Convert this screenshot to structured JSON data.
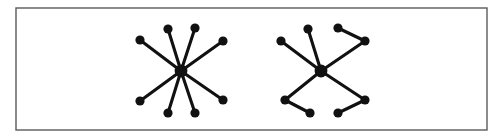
{
  "figure": {
    "kind": "graph-diagram",
    "caption": "",
    "background_color": "#ffffff",
    "ink_color": "#111111",
    "border": {
      "name": "figure-frame",
      "color": "#5a5a5a",
      "x": 16,
      "y": 8,
      "width": 471,
      "height": 122,
      "stroke_width": 1.4
    },
    "style": {
      "edge_width": 3.1,
      "leaf_radius": 4.6,
      "hub_radius": 6.4
    }
  },
  "chart_data": {
    "type": "graph",
    "title": "",
    "xlabel": "",
    "ylabel": "",
    "graphs": [
      {
        "id": "left-graph",
        "name": "star-graph",
        "label": "",
        "description": "Star K1,8 - central hub with eight leaves",
        "node_count": 9,
        "edge_count": 8,
        "hub_id": "L0",
        "nodes": [
          {
            "id": "L0",
            "x": 181,
            "y": 71,
            "role": "hub",
            "radius": 6.4
          },
          {
            "id": "L1",
            "x": 140,
            "y": 40,
            "role": "leaf",
            "radius": 4.6
          },
          {
            "id": "L2",
            "x": 168,
            "y": 29,
            "role": "leaf",
            "radius": 4.6
          },
          {
            "id": "L3",
            "x": 195,
            "y": 28,
            "role": "leaf",
            "radius": 4.6
          },
          {
            "id": "L4",
            "x": 223,
            "y": 41,
            "role": "leaf",
            "radius": 4.6
          },
          {
            "id": "L5",
            "x": 223,
            "y": 100,
            "role": "leaf",
            "radius": 4.6
          },
          {
            "id": "L6",
            "x": 195,
            "y": 113,
            "role": "leaf",
            "radius": 4.6
          },
          {
            "id": "L7",
            "x": 168,
            "y": 113,
            "role": "leaf",
            "radius": 4.6
          },
          {
            "id": "L8",
            "x": 140,
            "y": 101,
            "role": "leaf",
            "radius": 4.6
          }
        ],
        "edges": [
          [
            "L0",
            "L1"
          ],
          [
            "L0",
            "L2"
          ],
          [
            "L0",
            "L3"
          ],
          [
            "L0",
            "L4"
          ],
          [
            "L0",
            "L5"
          ],
          [
            "L0",
            "L6"
          ],
          [
            "L0",
            "L7"
          ],
          [
            "L0",
            "L8"
          ]
        ]
      },
      {
        "id": "right-graph",
        "name": "spider-graph",
        "label": "",
        "description": "Spider tree - hub with two pendant leaves and four legs of length two",
        "node_count": 11,
        "edge_count": 10,
        "hub_id": "R0",
        "nodes": [
          {
            "id": "R0",
            "x": 321,
            "y": 71,
            "role": "hub",
            "radius": 6.4
          },
          {
            "id": "R1",
            "x": 281,
            "y": 41,
            "role": "leaf",
            "radius": 4.6
          },
          {
            "id": "R2",
            "x": 308,
            "y": 29,
            "role": "leaf",
            "radius": 4.6
          },
          {
            "id": "R3",
            "x": 365,
            "y": 41,
            "role": "mid",
            "radius": 4.6
          },
          {
            "id": "R4",
            "x": 338,
            "y": 28,
            "role": "leaf",
            "radius": 4.6
          },
          {
            "id": "R5",
            "x": 365,
            "y": 100,
            "role": "mid",
            "radius": 4.6
          },
          {
            "id": "R6",
            "x": 338,
            "y": 113,
            "role": "leaf",
            "radius": 4.6
          },
          {
            "id": "R7",
            "x": 285,
            "y": 100,
            "role": "mid",
            "radius": 4.6
          },
          {
            "id": "R8",
            "x": 310,
            "y": 113,
            "role": "leaf",
            "radius": 4.6
          }
        ],
        "edges": [
          [
            "R0",
            "R1"
          ],
          [
            "R0",
            "R2"
          ],
          [
            "R0",
            "R3"
          ],
          [
            "R3",
            "R4"
          ],
          [
            "R0",
            "R5"
          ],
          [
            "R5",
            "R6"
          ],
          [
            "R0",
            "R7"
          ],
          [
            "R7",
            "R8"
          ]
        ]
      }
    ]
  }
}
